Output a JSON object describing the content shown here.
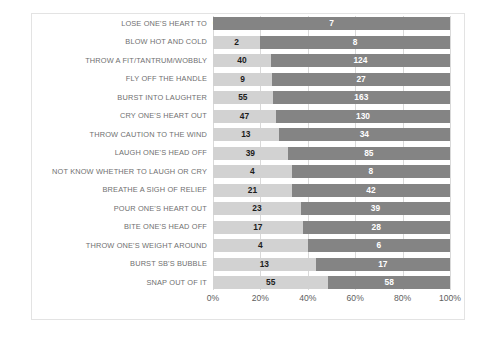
{
  "chart_data": {
    "type": "bar",
    "subtype": "stacked-horizontal-100-percent",
    "title": "",
    "xlabel": "",
    "ylabel": "",
    "xlim": [
      0,
      100
    ],
    "x_tick_labels": [
      "0%",
      "20%",
      "40%",
      "60%",
      "80%",
      "100%"
    ],
    "x_tick_values": [
      0,
      20,
      40,
      60,
      80,
      100
    ],
    "grid": true,
    "legend": "none",
    "colors": {
      "series_a": "#d2d2d2",
      "series_b": "#848484",
      "frame": "#e3e3e3",
      "gridline": "#d9d9d9",
      "label_text": "#6f6f6f",
      "tick_text": "#5e5e5e"
    },
    "categories": [
      "LOSE ONE'S HEART TO",
      "BLOW HOT AND COLD",
      "THROW A FIT/TANTRUM/WOBBLY",
      "FLY OFF THE HANDLE",
      "BURST INTO LAUGHTER",
      "CRY ONE'S HEART OUT",
      "THROW CAUTION TO THE WIND",
      "LAUGH ONE'S HEAD OFF",
      "NOT KNOW WHETHER TO LAUGH OR CRY",
      "BREATHE A SIGH OF RELIEF",
      "POUR ONE'S HEART OUT",
      "BITE ONE'S HEAD OFF",
      "THROW ONE'S WEIGHT AROUND",
      "BURST SB'S BUBBLE",
      "SNAP OUT OF IT"
    ],
    "series": [
      {
        "name": "series_a",
        "values": [
          0,
          2,
          40,
          9,
          55,
          47,
          13,
          39,
          4,
          21,
          23,
          17,
          4,
          13,
          55
        ]
      },
      {
        "name": "series_b",
        "values": [
          7,
          8,
          124,
          27,
          163,
          130,
          34,
          85,
          8,
          42,
          39,
          28,
          6,
          17,
          58
        ]
      }
    ],
    "rows": [
      {
        "label": "LOSE ONE'S HEART TO",
        "a": 0,
        "b": 7,
        "a_pct": 0.0,
        "b_pct": 100.0
      },
      {
        "label": "BLOW HOT AND COLD",
        "a": 2,
        "b": 8,
        "a_pct": 20.0,
        "b_pct": 80.0
      },
      {
        "label": "THROW A FIT/TANTRUM/WOBBLY",
        "a": 40,
        "b": 124,
        "a_pct": 24.4,
        "b_pct": 75.6
      },
      {
        "label": "FLY OFF THE HANDLE",
        "a": 9,
        "b": 27,
        "a_pct": 25.0,
        "b_pct": 75.0
      },
      {
        "label": "BURST INTO LAUGHTER",
        "a": 55,
        "b": 163,
        "a_pct": 25.2,
        "b_pct": 74.8
      },
      {
        "label": "CRY ONE'S HEART OUT",
        "a": 47,
        "b": 130,
        "a_pct": 26.6,
        "b_pct": 73.4
      },
      {
        "label": "THROW CAUTION TO THE WIND",
        "a": 13,
        "b": 34,
        "a_pct": 27.7,
        "b_pct": 72.3
      },
      {
        "label": "LAUGH ONE'S HEAD OFF",
        "a": 39,
        "b": 85,
        "a_pct": 31.5,
        "b_pct": 68.5
      },
      {
        "label": "NOT KNOW WHETHER TO LAUGH OR CRY",
        "a": 4,
        "b": 8,
        "a_pct": 33.3,
        "b_pct": 66.7
      },
      {
        "label": "BREATHE A SIGH OF RELIEF",
        "a": 21,
        "b": 42,
        "a_pct": 33.3,
        "b_pct": 66.7
      },
      {
        "label": "POUR ONE'S HEART OUT",
        "a": 23,
        "b": 39,
        "a_pct": 37.1,
        "b_pct": 62.9
      },
      {
        "label": "BITE ONE'S HEAD OFF",
        "a": 17,
        "b": 28,
        "a_pct": 37.8,
        "b_pct": 62.2
      },
      {
        "label": "THROW ONE'S WEIGHT AROUND",
        "a": 4,
        "b": 6,
        "a_pct": 40.0,
        "b_pct": 60.0
      },
      {
        "label": "BURST SB'S BUBBLE",
        "a": 13,
        "b": 17,
        "a_pct": 43.3,
        "b_pct": 56.7
      },
      {
        "label": "SNAP OUT OF IT",
        "a": 55,
        "b": 58,
        "a_pct": 48.7,
        "b_pct": 51.3
      }
    ]
  }
}
